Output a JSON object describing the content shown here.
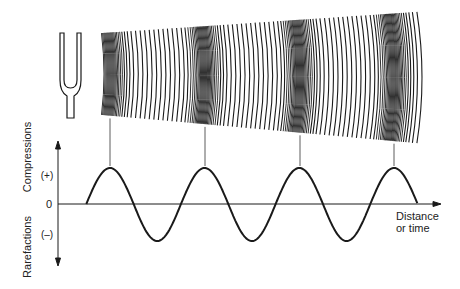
{
  "figure": {
    "source_label": "tuning-fork",
    "y_axis": {
      "upper_label": "Compressions",
      "lower_label": "Rarefactions",
      "plus_label": "(+)",
      "zero_label": "0",
      "minus_label": "(–)"
    },
    "x_axis": {
      "label_line1": "Distance",
      "label_line2": "or time"
    },
    "wave": {
      "type": "sine",
      "cycles": 3.5,
      "start_x": 84,
      "end_x": 418,
      "baseline_y": 204,
      "peak_y": 168,
      "trough_y": 241,
      "compression_x": [
        110,
        205,
        300,
        394
      ]
    },
    "colors": {
      "ink": "#1a1a1a",
      "background": "#ffffff"
    }
  }
}
